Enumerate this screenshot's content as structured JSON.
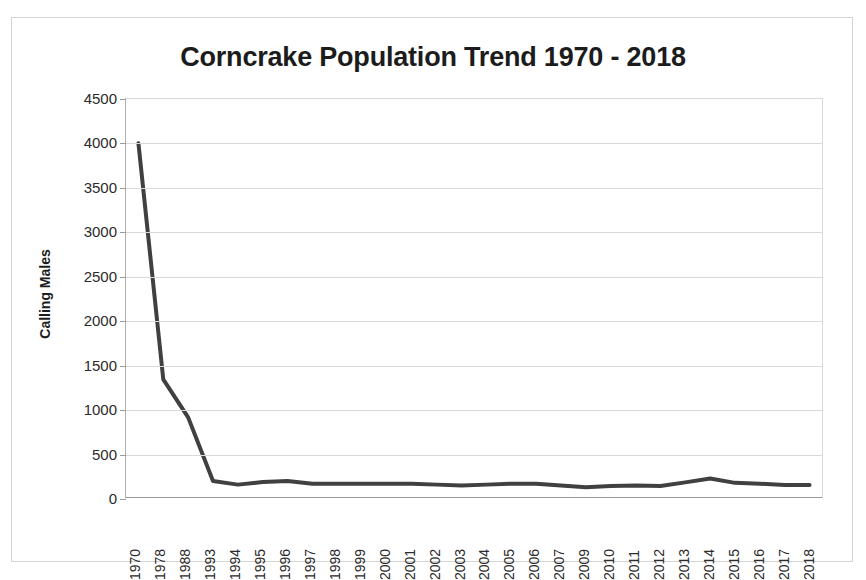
{
  "chart_data": {
    "type": "line",
    "title": "Corncrake Population Trend 1970 - 2018",
    "xlabel": "",
    "ylabel": "Calling Males",
    "ylim": [
      0,
      4500
    ],
    "ytick_step": 500,
    "yticks": [
      "0",
      "500",
      "1000",
      "1500",
      "2000",
      "2500",
      "3000",
      "3500",
      "4000",
      "4500"
    ],
    "grid": true,
    "legend": "none",
    "line_color": "#404040",
    "line_width": 4,
    "categories": [
      "1970",
      "1978",
      "1988",
      "1993",
      "1994",
      "1995",
      "1996",
      "1997",
      "1998",
      "1999",
      "2000",
      "2001",
      "2002",
      "2003",
      "2004",
      "2005",
      "2006",
      "2007",
      "2009",
      "2010",
      "2011",
      "2012",
      "2013",
      "2014",
      "2015",
      "2016",
      "2017",
      "2018"
    ],
    "series": [
      {
        "name": "Calling Males",
        "values": [
          4000,
          1330,
          900,
          180,
          140,
          170,
          180,
          150,
          150,
          150,
          150,
          150,
          140,
          130,
          140,
          150,
          150,
          130,
          110,
          125,
          130,
          125,
          165,
          210,
          160,
          150,
          135,
          135
        ]
      }
    ]
  },
  "figure": {
    "title": "Corncrake Population Trend 1970 - 2018",
    "y_axis_title": "Calling Males"
  }
}
